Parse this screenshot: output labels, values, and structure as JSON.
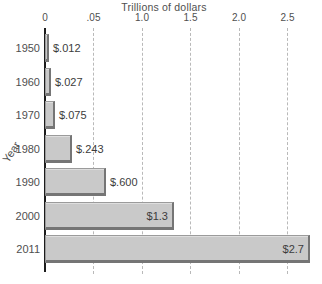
{
  "chart_data": {
    "type": "bar",
    "orientation": "horizontal",
    "title": "Trillions of dollars",
    "xlabel": "Trillions of dollars",
    "ylabel": "Year",
    "categories": [
      "1950",
      "1960",
      "1970",
      "1980",
      "1990",
      "2000",
      "2011"
    ],
    "values": [
      0.012,
      0.027,
      0.075,
      0.243,
      0.6,
      1.3,
      2.7
    ],
    "value_labels": [
      "$.012",
      "$.027",
      "$.075",
      "$.243",
      "$.600",
      "$1.3",
      "$2.7"
    ],
    "value_label_placement": [
      "outside",
      "outside",
      "outside",
      "outside",
      "outside",
      "inside",
      "inside"
    ],
    "x_ticks": [
      {
        "label": "0",
        "value": 0
      },
      {
        "label": ".05",
        "value": 0.5
      },
      {
        "label": "1.0",
        "value": 1.0
      },
      {
        "label": "1.5",
        "value": 1.5
      },
      {
        "label": "2.0",
        "value": 2.0
      },
      {
        "label": "2.5",
        "value": 2.5
      }
    ],
    "xlim": [
      0,
      2.85
    ],
    "grid": "dashed-vertical",
    "legend": "none",
    "colors": {
      "bar_fill": "#c9c9c9",
      "bar_border": "#9b9b9b",
      "bar_shadow": "#757575",
      "grid_color": "#b9b9b9",
      "axis_color": "#1c1c1c",
      "text_color": "#4f4f4f"
    }
  }
}
